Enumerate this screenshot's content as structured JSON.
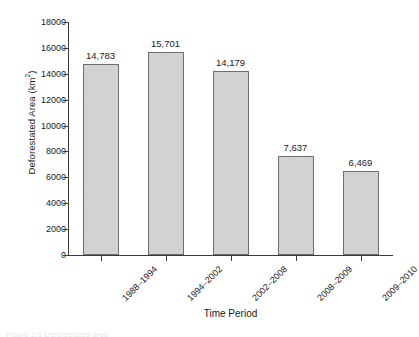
{
  "chart_data": {
    "type": "bar",
    "title": "",
    "xlabel": "Time Period",
    "ylabel": "Deforestated Area (km2)",
    "ylabel_text": "Deforestated Area (km",
    "ylabel_sup": "2",
    "ylabel_close": ")",
    "categories": [
      "1988–1994",
      "1994–2002",
      "2002–2008",
      "2008–2009",
      "2009–2010"
    ],
    "values": [
      14783,
      15701,
      14179,
      7637,
      6469
    ],
    "value_labels": [
      "14,783",
      "15,701",
      "14,179",
      "7,637",
      "6,469"
    ],
    "ylim": [
      0,
      18000
    ],
    "ytick_values": [
      0,
      2000,
      4000,
      6000,
      8000,
      10000,
      12000,
      14000,
      16000,
      18000
    ],
    "ytick_labels": [
      "0",
      "2000",
      "4000",
      "6000",
      "8000",
      "10000",
      "12000",
      "14000",
      "16000",
      "18000"
    ],
    "grid": false,
    "legend": false,
    "legend_position": "none",
    "bar_fill_color": "#d2d2d2",
    "bar_edge_color": "#6e6e6e",
    "axis_color": "#3a3a3a",
    "text_color": "#1a1a1a",
    "background_color": "#ffffff"
  },
  "caption_sliver": "Figure 2.1  Deforestated area"
}
